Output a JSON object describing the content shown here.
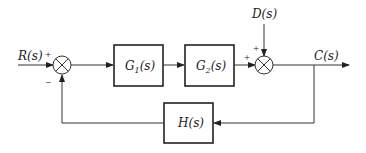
{
  "diagram": {
    "type": "feedback-control-block-diagram",
    "signals": {
      "input": "R(s)",
      "disturbance": "D(s)",
      "output": "C(s)"
    },
    "blocks": [
      {
        "id": "G1",
        "label_main": "G",
        "label_sub": "1",
        "label_tail": "(s)"
      },
      {
        "id": "G2",
        "label_main": "G",
        "label_sub": "2",
        "label_tail": "(s)"
      },
      {
        "id": "H",
        "label_main": "H",
        "label_sub": "",
        "label_tail": "(s)"
      }
    ],
    "summing_junctions": [
      {
        "id": "sum1",
        "signs": {
          "left": "+",
          "bottom": "−"
        }
      },
      {
        "id": "sum2",
        "signs": {
          "left": "+",
          "top": "+"
        }
      }
    ],
    "connections": [
      "R(s) -> sum1 (+)",
      "sum1 -> G1(s)",
      "G1(s) -> G2(s)",
      "G2(s) -> sum2 (+)",
      "D(s) -> sum2 (+)",
      "sum2 -> C(s)",
      "C(s) -> H(s)",
      "H(s) -> sum1 (−)"
    ]
  }
}
